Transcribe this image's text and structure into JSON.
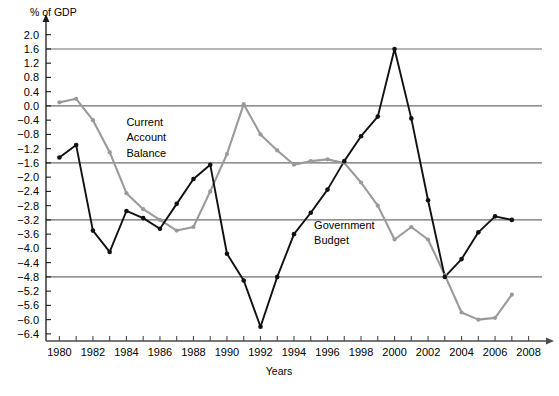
{
  "chart_data": {
    "type": "line",
    "title": "",
    "subtitle": "",
    "ylabel": "% of GDP",
    "xlabel": "Years",
    "xlim": [
      1979.2,
      2008.8
    ],
    "ylim": [
      -6.6,
      2.3
    ],
    "grid": true,
    "gridlines_y": [
      1.6,
      0.0,
      -1.6,
      -3.2,
      -4.8
    ],
    "legend_position": "inline-annotations",
    "yticks": [
      2.0,
      1.6,
      1.2,
      0.8,
      0.4,
      0.0,
      -0.4,
      -0.8,
      -1.2,
      -1.6,
      -2.0,
      -2.4,
      -2.8,
      -3.2,
      -3.6,
      -4.0,
      -4.4,
      -4.8,
      -5.2,
      -5.6,
      -6.0,
      -6.4
    ],
    "ytick_labels": [
      "2.0",
      "1.6",
      "1.2",
      "0.8",
      "0.4",
      "0.0",
      "−0.4",
      "−0.8",
      "−1.2",
      "−1.6",
      "−2.0",
      "−2.4",
      "−2.8",
      "−3.2",
      "−3.6",
      "−4.0",
      "−4.4",
      "−4.8",
      "−5.2",
      "−5.6",
      "−6.0",
      "−6.4"
    ],
    "xticks": [
      1980,
      1981,
      1982,
      1983,
      1984,
      1985,
      1986,
      1987,
      1988,
      1989,
      1990,
      1991,
      1992,
      1993,
      1994,
      1995,
      1996,
      1997,
      1998,
      1999,
      2000,
      2001,
      2002,
      2003,
      2004,
      2005,
      2006,
      2007,
      2008
    ],
    "xtick_labels_shown": [
      1980,
      1982,
      1984,
      1986,
      1988,
      1990,
      1992,
      1994,
      1996,
      1998,
      2000,
      2002,
      2004,
      2006,
      2008
    ],
    "series": [
      {
        "name": "Government Budget",
        "color": "#111111",
        "marker": "circle",
        "label_x": 1995.2,
        "label_y": -3.45,
        "x": [
          1980,
          1981,
          1982,
          1983,
          1984,
          1985,
          1986,
          1987,
          1988,
          1989,
          1990,
          1991,
          1992,
          1993,
          1994,
          1995,
          1996,
          1997,
          1998,
          1999,
          2000,
          2001,
          2002,
          2003,
          2004,
          2005,
          2006,
          2007
        ],
        "values": [
          -1.45,
          -1.1,
          -3.5,
          -4.1,
          -2.95,
          -3.15,
          -3.45,
          -2.75,
          -2.05,
          -1.65,
          -4.15,
          -4.9,
          -6.2,
          -4.8,
          -3.6,
          -3.0,
          -2.35,
          -1.55,
          -0.85,
          -0.3,
          1.6,
          -0.35,
          -2.65,
          -4.8,
          -4.3,
          -3.55,
          -3.1,
          -3.2
        ]
      },
      {
        "name": "Current Account Balance",
        "color": "#9a9a9a",
        "marker": "circle",
        "label_x": 1984.0,
        "label_y": -0.55,
        "x": [
          1980,
          1981,
          1982,
          1983,
          1984,
          1985,
          1986,
          1987,
          1988,
          1989,
          1990,
          1991,
          1992,
          1993,
          1994,
          1995,
          1996,
          1997,
          1998,
          1999,
          2000,
          2001,
          2002,
          2003,
          2004,
          2005,
          2006,
          2007
        ],
        "values": [
          0.1,
          0.2,
          -0.4,
          -1.3,
          -2.45,
          -2.9,
          -3.2,
          -3.5,
          -3.4,
          -2.4,
          -1.35,
          0.05,
          -0.8,
          -1.25,
          -1.65,
          -1.55,
          -1.5,
          -1.6,
          -2.15,
          -2.8,
          -3.75,
          -3.4,
          -3.75,
          -4.75,
          -5.8,
          -6.0,
          -5.95,
          -5.3
        ]
      }
    ]
  },
  "annotations": {
    "current_account_label_lines": [
      "Current",
      "Account",
      "Balance"
    ],
    "government_budget_label_lines": [
      "Government",
      "Budget"
    ]
  },
  "axis": {
    "y_axis_title": "% of GDP",
    "x_axis_title": "Years"
  }
}
